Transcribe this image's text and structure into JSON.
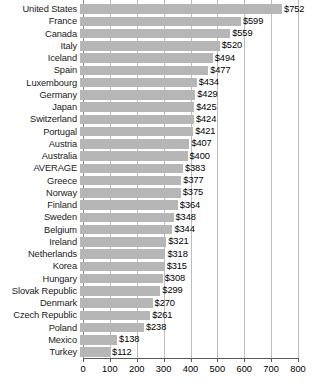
{
  "chart_data": {
    "type": "bar",
    "orientation": "horizontal",
    "title": "",
    "subtitle": "",
    "xlabel": "",
    "ylabel": "",
    "xlim": [
      0,
      800
    ],
    "xticks": [
      0,
      100,
      200,
      300,
      400,
      500,
      600,
      700,
      800
    ],
    "xtick_labels": [
      "0",
      "100",
      "200",
      "300",
      "400",
      "500",
      "600",
      "700",
      "800"
    ],
    "grid": true,
    "legend": null,
    "value_prefix": "$",
    "bar_color": "#b6b6b6",
    "categories": [
      "United States",
      "France",
      "Canada",
      "Italy",
      "Iceland",
      "Spain",
      "Luxembourg",
      "Germany",
      "Japan",
      "Switzerland",
      "Portugal",
      "Austria",
      "Australia",
      "AVERAGE",
      "Greece",
      "Norway",
      "Finland",
      "Sweden",
      "Belgium",
      "Ireland",
      "Netherlands",
      "Korea",
      "Hungary",
      "Slovak Republic",
      "Denmark",
      "Czech Republic",
      "Poland",
      "Mexico",
      "Turkey"
    ],
    "values": [
      752,
      599,
      559,
      520,
      494,
      477,
      434,
      429,
      425,
      424,
      421,
      407,
      400,
      383,
      377,
      375,
      364,
      348,
      344,
      321,
      318,
      315,
      308,
      299,
      270,
      261,
      238,
      138,
      112
    ],
    "data_labels": [
      "$752",
      "$599",
      "$559",
      "$520",
      "$494",
      "$477",
      "$434",
      "$429",
      "$425",
      "$424",
      "$421",
      "$407",
      "$400",
      "$383",
      "$377",
      "$375",
      "$364",
      "$348",
      "$344",
      "$321",
      "$318",
      "$315",
      "$308",
      "$299",
      "$270",
      "$261",
      "$238",
      "$138",
      "$112"
    ]
  }
}
